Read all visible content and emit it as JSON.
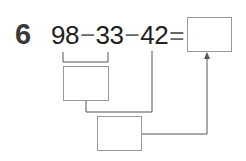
{
  "problem": {
    "number": "6",
    "operands": [
      "98",
      "33",
      "42"
    ],
    "operators": [
      "−",
      "−",
      "="
    ],
    "answer_box": "",
    "intermediate_box_1": "",
    "intermediate_box_2": ""
  },
  "colors": {
    "line": "#555555",
    "box_border": "#999999",
    "text": "#222222"
  }
}
